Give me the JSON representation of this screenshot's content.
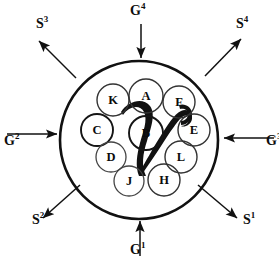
{
  "figure": {
    "type": "schematic-diagram",
    "stroke_color": "#111111",
    "background_color": "#ffffff",
    "boundary": {
      "shape": "circle",
      "cx": 139,
      "cy": 140,
      "r": 79
    },
    "external_arrows": [
      {
        "id": "g4",
        "label_base": "G",
        "label_sup": "4",
        "label_full": "G4",
        "direction": "inward",
        "position": "top",
        "label_x": 130,
        "label_y": 4,
        "x1": 141,
        "y1": 24,
        "x2": 141,
        "y2": 58
      },
      {
        "id": "s4",
        "label_base": "S",
        "label_sup": "4",
        "label_full": "S4",
        "direction": "outward",
        "position": "top-right",
        "label_x": 236,
        "label_y": 17,
        "x1": 205,
        "y1": 76,
        "x2": 240,
        "y2": 40
      },
      {
        "id": "g3",
        "label_base": "G",
        "label_sup": "3",
        "label_full": "G3",
        "direction": "inward",
        "position": "right",
        "label_x": 266,
        "label_y": 134,
        "x1": 273,
        "y1": 138,
        "x2": 224,
        "y2": 138
      },
      {
        "id": "s1",
        "label_base": "S",
        "label_sup": "1",
        "label_full": "S1",
        "direction": "outward",
        "position": "bottom-right",
        "label_x": 243,
        "label_y": 213,
        "x1": 198,
        "y1": 185,
        "x2": 236,
        "y2": 217
      },
      {
        "id": "g1",
        "label_base": "G",
        "label_sup": "1",
        "label_full": "G1",
        "direction": "inward",
        "position": "bottom",
        "label_x": 130,
        "label_y": 243,
        "x1": 140,
        "y1": 255,
        "x2": 140,
        "y2": 221
      },
      {
        "id": "s2",
        "label_base": "S",
        "label_sup": "2",
        "label_full": "S2",
        "direction": "outward",
        "position": "bottom-left",
        "label_x": 32,
        "label_y": 213,
        "x1": 80,
        "y1": 185,
        "x2": 44,
        "y2": 217
      },
      {
        "id": "g2",
        "label_base": "G",
        "label_sup": "2",
        "label_full": "G2",
        "direction": "inward",
        "position": "left",
        "label_x": 4,
        "label_y": 134,
        "x1": 8,
        "y1": 134,
        "x2": 57,
        "y2": 134
      },
      {
        "id": "s3",
        "label_base": "S",
        "label_sup": "3",
        "label_full": "S3",
        "direction": "outward",
        "position": "top-left",
        "label_x": 36,
        "label_y": 17,
        "x1": 76,
        "y1": 78,
        "x2": 40,
        "y2": 42
      }
    ],
    "nodes": [
      {
        "id": "K",
        "label": "K",
        "cx": 113,
        "cy": 100,
        "r": 16
      },
      {
        "id": "A",
        "label": "A",
        "cx": 146,
        "cy": 96,
        "r": 17
      },
      {
        "id": "F",
        "label": "F",
        "cx": 179,
        "cy": 102,
        "r": 16
      },
      {
        "id": "C",
        "label": "C",
        "cx": 97,
        "cy": 130,
        "r": 16
      },
      {
        "id": "E",
        "label": "E",
        "cx": 194,
        "cy": 130,
        "r": 16
      },
      {
        "id": "B",
        "label": "B",
        "cx": 146,
        "cy": 133,
        "r": 17
      },
      {
        "id": "D",
        "label": "D",
        "cx": 111,
        "cy": 157,
        "r": 15
      },
      {
        "id": "L",
        "label": "L",
        "cx": 181,
        "cy": 157,
        "r": 16
      },
      {
        "id": "J",
        "label": "J",
        "cx": 129,
        "cy": 181,
        "r": 15
      },
      {
        "id": "H",
        "label": "H",
        "cx": 164,
        "cy": 180,
        "r": 16
      }
    ],
    "center_mark": {
      "id": "v-stroke",
      "description": "thick hand-drawn V / checkmark stroke over the centre",
      "fill": "#111111"
    }
  }
}
